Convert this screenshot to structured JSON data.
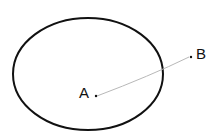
{
  "diagram": {
    "ellipse": {
      "cx": 88,
      "cy": 74,
      "rx": 75,
      "ry": 56,
      "stroke": "#111111"
    },
    "points": [
      {
        "label": "A",
        "x": 96,
        "y": 96
      },
      {
        "label": "B",
        "x": 191,
        "y": 57
      }
    ],
    "line": {
      "from": "A",
      "to": "B",
      "color": "#b8b8b8"
    }
  }
}
